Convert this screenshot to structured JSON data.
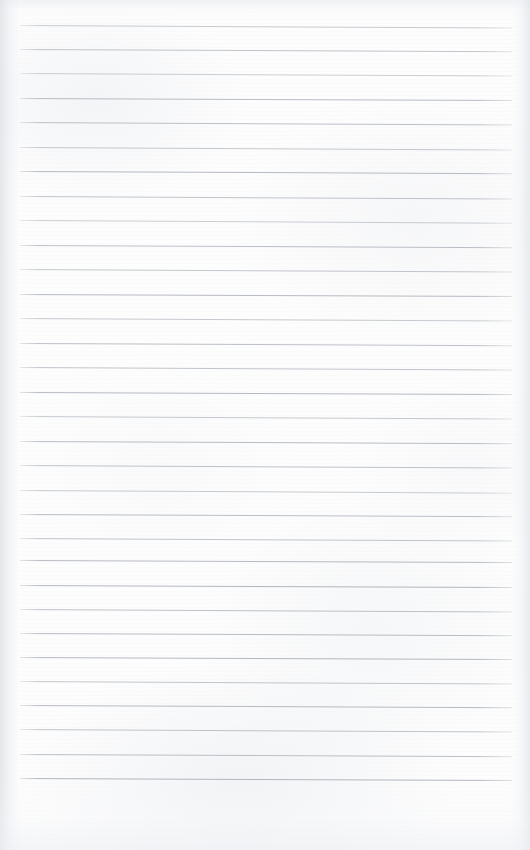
{
  "document": {
    "kind": "blank-ruled-notebook-page",
    "title": "Blank Ruled Notebook Page",
    "page_width": 530,
    "page_height": 850,
    "has_text_content": false,
    "has_margin_rule": false,
    "has_punch_holes": false,
    "handwriting": "",
    "typed_text": ""
  },
  "paper": {
    "background_color": "#fdfdfd",
    "edge_shadow_color": "#dee1e6",
    "grain_color": "#eceef2"
  },
  "ruling": {
    "line_color": "#a8adb6",
    "line_color_light": "#b9bdc5",
    "line_thickness_px": 1,
    "line_spacing_px": 24.3,
    "first_line_y": 25,
    "last_line_y": 778,
    "line_start_x": 20,
    "line_end_x": 512,
    "line_count": 32,
    "skew_degrees": 0.28,
    "top_margin_px": 25,
    "bottom_margin_px": 72,
    "lines": [
      {
        "index": 1,
        "y": 25,
        "opacity": 0.62,
        "skew": 0.3
      },
      {
        "index": 2,
        "y": 49,
        "opacity": 0.7,
        "skew": 0.26
      },
      {
        "index": 3,
        "y": 73,
        "opacity": 0.58,
        "skew": 0.3
      },
      {
        "index": 4,
        "y": 98,
        "opacity": 0.8,
        "skew": 0.24
      },
      {
        "index": 5,
        "y": 122,
        "opacity": 0.74,
        "skew": 0.28
      },
      {
        "index": 6,
        "y": 147,
        "opacity": 0.66,
        "skew": 0.3
      },
      {
        "index": 7,
        "y": 171,
        "opacity": 0.84,
        "skew": 0.25
      },
      {
        "index": 8,
        "y": 196,
        "opacity": 0.72,
        "skew": 0.29
      },
      {
        "index": 9,
        "y": 220,
        "opacity": 0.6,
        "skew": 0.31
      },
      {
        "index": 10,
        "y": 245,
        "opacity": 0.78,
        "skew": 0.26
      },
      {
        "index": 11,
        "y": 269,
        "opacity": 0.68,
        "skew": 0.28
      },
      {
        "index": 12,
        "y": 294,
        "opacity": 0.82,
        "skew": 0.24
      },
      {
        "index": 13,
        "y": 318,
        "opacity": 0.64,
        "skew": 0.3
      },
      {
        "index": 14,
        "y": 343,
        "opacity": 0.76,
        "skew": 0.27
      },
      {
        "index": 15,
        "y": 367,
        "opacity": 0.7,
        "skew": 0.29
      },
      {
        "index": 16,
        "y": 392,
        "opacity": 0.86,
        "skew": 0.23
      },
      {
        "index": 17,
        "y": 416,
        "opacity": 0.66,
        "skew": 0.3
      },
      {
        "index": 18,
        "y": 441,
        "opacity": 0.8,
        "skew": 0.25
      },
      {
        "index": 19,
        "y": 465,
        "opacity": 0.72,
        "skew": 0.28
      },
      {
        "index": 20,
        "y": 490,
        "opacity": 0.62,
        "skew": 0.31
      },
      {
        "index": 21,
        "y": 514,
        "opacity": 0.78,
        "skew": 0.26
      },
      {
        "index": 22,
        "y": 538,
        "opacity": 0.7,
        "skew": 0.29
      },
      {
        "index": 23,
        "y": 560,
        "opacity": 0.84,
        "skew": 0.24
      },
      {
        "index": 24,
        "y": 585,
        "opacity": 0.88,
        "skew": 0.22
      },
      {
        "index": 25,
        "y": 609,
        "opacity": 0.74,
        "skew": 0.28
      },
      {
        "index": 26,
        "y": 633,
        "opacity": 0.8,
        "skew": 0.25
      },
      {
        "index": 27,
        "y": 657,
        "opacity": 0.86,
        "skew": 0.23
      },
      {
        "index": 28,
        "y": 681,
        "opacity": 0.68,
        "skew": 0.3
      },
      {
        "index": 29,
        "y": 705,
        "opacity": 0.82,
        "skew": 0.25
      },
      {
        "index": 30,
        "y": 729,
        "opacity": 0.7,
        "skew": 0.29
      },
      {
        "index": 31,
        "y": 754,
        "opacity": 0.76,
        "skew": 0.27
      },
      {
        "index": 32,
        "y": 778,
        "opacity": 0.88,
        "skew": 0.22
      }
    ]
  }
}
